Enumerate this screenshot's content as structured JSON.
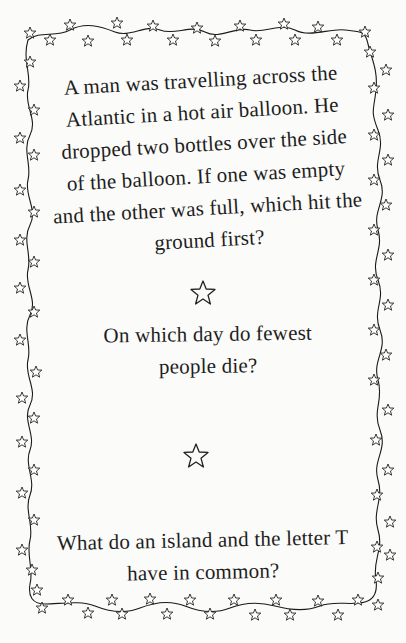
{
  "page": {
    "background": "#fbfbf9",
    "ink": "#1e1e1e"
  },
  "border": {
    "style": "wavy vine with hanging outline stars",
    "icon": "star-outline-icon"
  },
  "riddles": [
    {
      "lines": [
        "A man was travelling across the",
        "Atlantic in a hot air balloon. He",
        "dropped two bottles over the side",
        "of the balloon. If one was empty",
        "and the other was full, which hit the",
        "ground first?"
      ]
    },
    {
      "lines": [
        "On which day do fewest",
        "people die?"
      ]
    },
    {
      "lines": [
        "What do an island and the letter T",
        "have in common?"
      ]
    }
  ],
  "dividers": [
    {
      "icon": "star-outline-icon"
    },
    {
      "icon": "star-outline-icon"
    }
  ]
}
